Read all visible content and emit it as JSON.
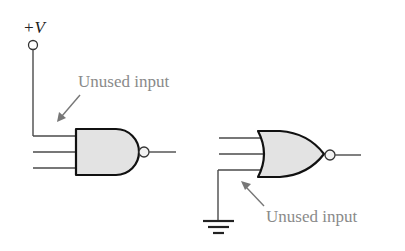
{
  "supply": {
    "label": "+V"
  },
  "nand_gate": {
    "type": "NAND",
    "inputs": 3,
    "unused_input_tied_to": "+V",
    "annotation": "Unused input"
  },
  "nor_gate": {
    "type": "NOR",
    "inputs": 3,
    "unused_input_tied_to": "ground",
    "annotation": "Unused input"
  },
  "colors": {
    "gate_fill": "#e3e3e3",
    "gate_stroke": "#111111",
    "annotation_text": "#8a8a8a",
    "wire": "#4a4a4a"
  }
}
